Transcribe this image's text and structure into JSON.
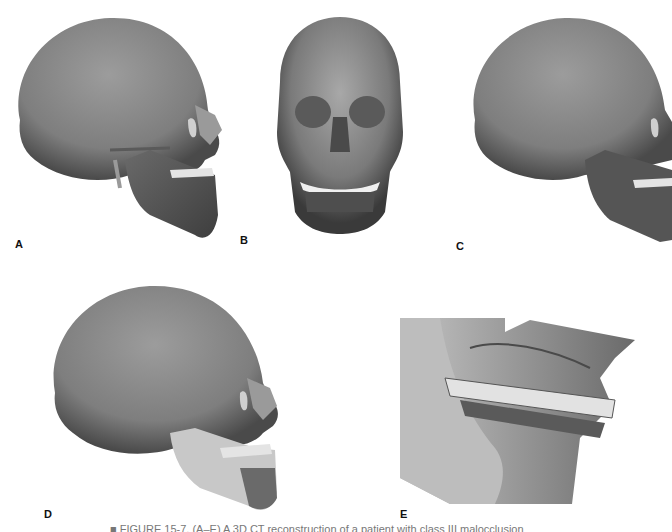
{
  "figure": {
    "panels": [
      {
        "id": "A",
        "label": "A",
        "view": "left lateral 3D CT skull reconstruction"
      },
      {
        "id": "B",
        "label": "B",
        "view": "frontal 3D CT skull reconstruction"
      },
      {
        "id": "C",
        "label": "C",
        "view": "lateral 3D CT skull reconstruction"
      },
      {
        "id": "D",
        "label": "D",
        "view": "lateral 3D CT skull reconstruction with highlighted mandible"
      },
      {
        "id": "E",
        "label": "E",
        "view": "close-up lateral view of dentition and occlusion"
      }
    ],
    "caption": "■ FIGURE 15-7. (A–E) A 3D CT reconstruction of a patient with class III malocclusion"
  },
  "colors": {
    "background": "#ffffff",
    "bone_mid": "#8a8a8a",
    "bone_dark": "#4a4a4a",
    "bone_light": "#b8b8b8",
    "teeth": "#e4e4e4",
    "mandible_highlight": "#c8c8c8"
  }
}
